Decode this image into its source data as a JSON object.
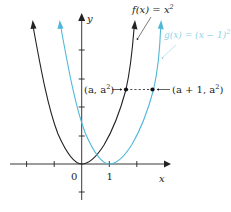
{
  "figure": {
    "axes": {
      "x_label": "x",
      "y_label": "y",
      "origin_label": "0",
      "x_tick_label": "1",
      "x_ticks": [
        -3,
        -2,
        0,
        1,
        2
      ],
      "y_ticks_count_above": 4,
      "y_ticks_count_below": 1
    },
    "curves": [
      {
        "name": "f",
        "label_lhs": "f(x) = x",
        "label_exp": "2",
        "color": "#222222",
        "vertex_x": 0
      },
      {
        "name": "g",
        "label_lhs": "g(x) = (x − 1)",
        "label_exp": "2",
        "color": "#4fb8d8",
        "vertex_x": 1
      }
    ],
    "points": [
      {
        "name": "point-a",
        "label_pre": "(a, a",
        "label_exp": "2",
        "label_post": ")"
      },
      {
        "name": "point-a-plus-1",
        "label_pre": "(a + 1, a",
        "label_exp": "2",
        "label_post": ")"
      }
    ],
    "connector": "dashed horizontal line"
  }
}
